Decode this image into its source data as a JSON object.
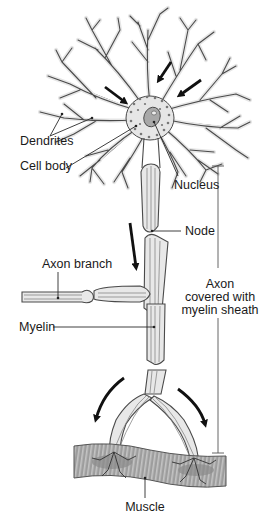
{
  "diagram": {
    "background": "#ffffff",
    "colors": {
      "line": "#4a4a4a",
      "fill_light": "#e8e8e8",
      "muscle": "#9a9a9a",
      "arrow": "#111111",
      "text": "#1a1a1a"
    }
  },
  "labels": {
    "dendrites": {
      "text": "Dendrites",
      "x": 20,
      "y": 145
    },
    "cell_body": {
      "text": "Cell body",
      "x": 20,
      "y": 170
    },
    "nucleus": {
      "text": "Nucleus",
      "x": 174,
      "y": 189
    },
    "node": {
      "text": "Node",
      "x": 185,
      "y": 234
    },
    "axon_branch": {
      "text": "Axon branch",
      "x": 42,
      "y": 268
    },
    "axon_sheath": {
      "line1": "Axon",
      "line2": "covered with",
      "line3": "myelin sheath",
      "x": 218,
      "y": 288
    },
    "myelin": {
      "text": "Myelin",
      "x": 20,
      "y": 330
    },
    "muscle": {
      "text": "Muscle",
      "x": 145,
      "y": 511
    }
  },
  "bracket": {
    "x": 218,
    "y_top": 166,
    "y_bottom": 453,
    "gap_top": 268,
    "gap_bottom": 318
  },
  "flow_arrows": [
    {
      "name": "dendrite-arrow-upper-left",
      "from": [
        105,
        87
      ],
      "to": [
        128,
        104
      ]
    },
    {
      "name": "dendrite-arrow-upper-right",
      "from": [
        171,
        62
      ],
      "to": [
        157,
        83
      ]
    },
    {
      "name": "dendrite-arrow-right",
      "from": [
        201,
        80
      ],
      "to": [
        177,
        97
      ]
    },
    {
      "name": "axon-arrow-down",
      "from": [
        130,
        223
      ],
      "to": [
        137,
        271
      ]
    }
  ],
  "curved_arrows": [
    {
      "name": "branch-arrow-left",
      "d": "M124 378 Q 103 393 95 423"
    },
    {
      "name": "branch-arrow-right",
      "d": "M178 389 Q 200 405 206 428"
    }
  ]
}
